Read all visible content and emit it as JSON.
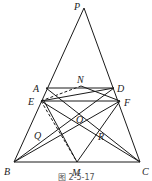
{
  "diagram": {
    "points": [
      "P",
      "A",
      "D",
      "N",
      "E",
      "F",
      "O",
      "Q",
      "R",
      "B",
      "M",
      "C"
    ],
    "caption": "图 2-5-17",
    "segments": [
      [
        "P",
        "B"
      ],
      [
        "P",
        "C"
      ],
      [
        "A",
        "D"
      ],
      [
        "B",
        "C"
      ],
      [
        "E",
        "F"
      ],
      [
        "A",
        "C"
      ],
      [
        "D",
        "B"
      ],
      [
        "E",
        "N"
      ],
      [
        "N",
        "F"
      ],
      [
        "E",
        "C"
      ],
      [
        "F",
        "B"
      ],
      [
        "E",
        "O"
      ],
      [
        "O",
        "F"
      ],
      [
        "M",
        "E"
      ],
      [
        "M",
        "F"
      ],
      [
        "E",
        "D"
      ]
    ],
    "dashed_segments": [
      [
        "E",
        "M"
      ],
      [
        "E",
        "N"
      ]
    ]
  }
}
